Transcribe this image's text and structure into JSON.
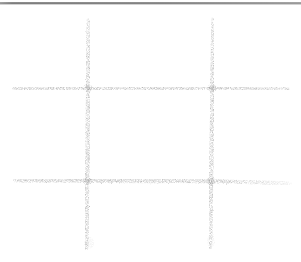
{
  "image": {
    "kind": "hand-drawn-sketch",
    "subject": "tic-tac-toe grid",
    "caption": "A hand-drawn pencil tic-tac-toe hash grid on white paper",
    "width": 301,
    "height": 262,
    "background_color": "#ffffff",
    "medium": "pencil"
  },
  "colors": {
    "paper": "#ffffff",
    "stroke_dark": "#7f7f7f",
    "stroke_mid": "#9a9a9a",
    "stroke_light": "#b9b9b9",
    "scan_rule": "#7a7a7a"
  },
  "scan_artifact": {
    "name": "top-edge-rule",
    "y": 3,
    "x_start": 0,
    "x_end": 301,
    "thickness": 1.6,
    "color": "#7a7a7a"
  },
  "strokes": [
    {
      "id": "vertical-left",
      "orientation": "vertical",
      "x_top": 88,
      "y_top": 20,
      "x_bottom": 86,
      "y_bottom": 248,
      "width": 4.2,
      "color": "#949494",
      "taper": "top"
    },
    {
      "id": "vertical-right",
      "orientation": "vertical",
      "x_top": 213,
      "y_top": 19,
      "x_bottom": 210,
      "y_bottom": 247,
      "width": 4.0,
      "color": "#949494",
      "taper": "top"
    },
    {
      "id": "horizontal-top",
      "orientation": "horizontal",
      "x_start": 14,
      "y_start": 88,
      "x_end": 288,
      "y_end": 89,
      "width": 3.6,
      "color": "#9a9a9a",
      "taper": "both"
    },
    {
      "id": "horizontal-bottom",
      "orientation": "horizontal",
      "x_start": 15,
      "y_start": 180,
      "x_end": 290,
      "y_end": 183,
      "width": 3.8,
      "color": "#9a9a9a",
      "taper": "right"
    }
  ],
  "cells": {
    "count": 9,
    "marks": [],
    "note": "empty board"
  }
}
